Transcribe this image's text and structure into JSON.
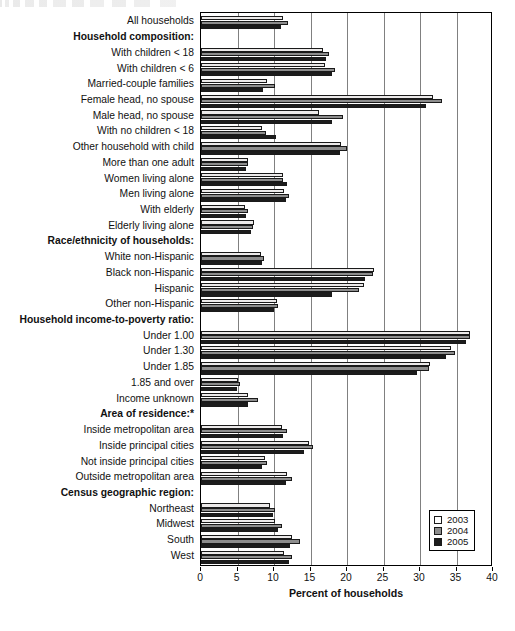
{
  "chart_data": {
    "type": "bar",
    "orientation": "horizontal",
    "title": "",
    "xlabel": "Percent of households",
    "ylabel": "",
    "xlim": [
      0,
      40
    ],
    "xticks": [
      0,
      5,
      10,
      15,
      20,
      25,
      30,
      35,
      40
    ],
    "grid": true,
    "legend_position": "bottom-right",
    "legend": [
      "2003",
      "2004",
      "2005"
    ],
    "series": [
      {
        "name": "2003",
        "color": "#eceaea"
      },
      {
        "name": "2004",
        "color": "#8d8d8d"
      },
      {
        "name": "2005",
        "color": "#1c1c1c"
      }
    ],
    "rows": [
      {
        "label": "All households",
        "header": false,
        "values": [
          11.2,
          11.9,
          11.0
        ]
      },
      {
        "label": "Household composition:",
        "header": true,
        "values": null
      },
      {
        "label": "With children < 18",
        "header": false,
        "values": [
          16.7,
          17.6,
          17.1
        ]
      },
      {
        "label": "With children < 6",
        "header": false,
        "values": [
          17.0,
          18.4,
          17.9
        ]
      },
      {
        "label": "Married-couple families",
        "header": false,
        "values": [
          9.0,
          10.2,
          8.5
        ]
      },
      {
        "label": "Female head, no spouse",
        "header": false,
        "values": [
          31.8,
          33.0,
          30.8
        ]
      },
      {
        "label": "Male head, no spouse",
        "header": false,
        "values": [
          16.1,
          19.4,
          17.9
        ]
      },
      {
        "label": "With no children < 18",
        "header": false,
        "values": [
          8.3,
          8.9,
          10.3
        ]
      },
      {
        "label": "Other household with child",
        "header": false,
        "values": [
          19.2,
          20.0,
          19.0
        ]
      },
      {
        "label": "More than one adult",
        "header": false,
        "values": [
          6.4,
          6.5,
          6.2
        ]
      },
      {
        "label": "Women living alone",
        "header": false,
        "values": [
          11.3,
          11.2,
          11.8
        ]
      },
      {
        "label": "Men living alone",
        "header": false,
        "values": [
          11.4,
          12.0,
          11.7
        ]
      },
      {
        "label": "With elderly",
        "header": false,
        "values": [
          6.0,
          6.5,
          6.1
        ]
      },
      {
        "label": "Elderly living alone",
        "header": false,
        "values": [
          7.3,
          7.1,
          6.8
        ]
      },
      {
        "label": "Race/ethnicity of households:",
        "header": true,
        "values": null
      },
      {
        "label": "White non-Hispanic",
        "header": false,
        "values": [
          8.2,
          8.6,
          8.4
        ]
      },
      {
        "label": "Black non-Hispanic",
        "header": false,
        "values": [
          23.7,
          23.5,
          22.4
        ]
      },
      {
        "label": "Hispanic",
        "header": false,
        "values": [
          22.3,
          21.7,
          17.9
        ]
      },
      {
        "label": "Other non-Hispanic",
        "header": false,
        "values": [
          10.4,
          10.5,
          10.0
        ]
      },
      {
        "label": "Household income-to-poverty ratio:",
        "header": true,
        "values": null
      },
      {
        "label": "Under 1.00",
        "header": false,
        "values": [
          36.9,
          36.8,
          36.3
        ]
      },
      {
        "label": "Under 1.30",
        "header": false,
        "values": [
          34.2,
          34.8,
          33.6
        ]
      },
      {
        "label": "Under 1.85",
        "header": false,
        "values": [
          31.4,
          31.2,
          29.6
        ]
      },
      {
        "label": "1.85 and over",
        "header": false,
        "values": [
          5.1,
          5.4,
          4.9
        ]
      },
      {
        "label": "Income unknown",
        "header": false,
        "values": [
          6.5,
          7.8,
          6.4
        ]
      },
      {
        "label": "Area of residence:*",
        "header": true,
        "values": null
      },
      {
        "label": "Inside metropolitan area",
        "header": false,
        "values": [
          11.1,
          11.8,
          11.2
        ]
      },
      {
        "label": "Inside principal cities",
        "header": false,
        "values": [
          14.8,
          15.4,
          14.1
        ]
      },
      {
        "label": "Not inside principal cities",
        "header": false,
        "values": [
          8.8,
          9.1,
          8.3
        ]
      },
      {
        "label": "Outside metropolitan area",
        "header": false,
        "values": [
          11.8,
          12.4,
          11.6
        ]
      },
      {
        "label": "Census geographic region:",
        "header": true,
        "values": null
      },
      {
        "label": "Northeast",
        "header": false,
        "values": [
          9.5,
          10.1,
          9.8
        ]
      },
      {
        "label": "Midwest",
        "header": false,
        "values": [
          10.1,
          11.1,
          10.6
        ]
      },
      {
        "label": "South",
        "header": false,
        "values": [
          12.4,
          13.6,
          12.2
        ]
      },
      {
        "label": "West",
        "header": false,
        "values": [
          11.4,
          12.5,
          12.1
        ]
      }
    ]
  }
}
